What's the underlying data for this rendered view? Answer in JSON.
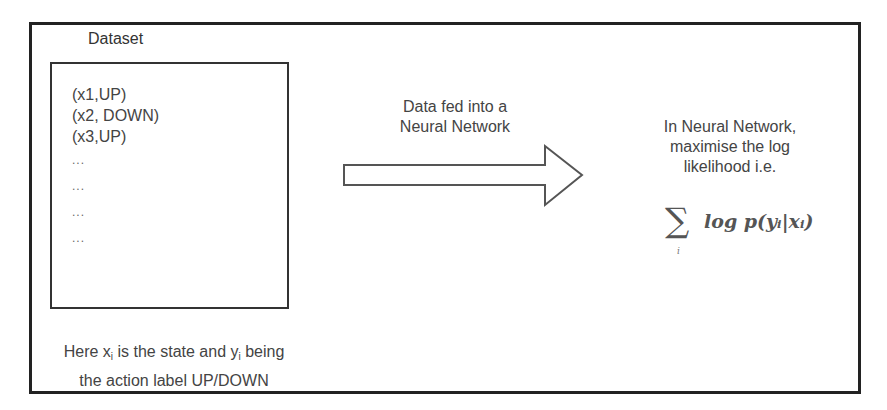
{
  "dataset": {
    "title": "Dataset",
    "rows": [
      "(x1,UP)",
      "(x2, DOWN)",
      "(x3,UP)"
    ],
    "ellipses": [
      "...",
      "...",
      "...",
      "..."
    ]
  },
  "note": {
    "part1": "Here x",
    "sub1": "i",
    "part2": " is the state and y",
    "sub2": "i",
    "part3": " being",
    "line2": "the action label UP/DOWN"
  },
  "arrow": {
    "label_line1": "Data fed into a",
    "label_line2": "Neural Network"
  },
  "neural_network": {
    "line1": "In Neural Network,",
    "line2": "maximise the log",
    "line3": "likelihood i.e.",
    "formula": {
      "sum_symbol": "∑",
      "sum_index": "i",
      "expression": "log p(yᵢ|xᵢ)"
    }
  }
}
